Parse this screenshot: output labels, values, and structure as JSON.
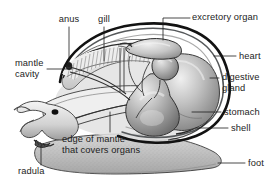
{
  "figure": {
    "organism": "snail",
    "style": "grayscale airbrushed scientific illustration",
    "background_color": "#ffffff",
    "line_color": "#1d1d1d",
    "label_text_color": "#1d1d1d",
    "palette": {
      "outline": "#151515",
      "shell_light": "#e8e8e8",
      "shell_mid": "#b9b9b9",
      "shell_dark": "#6e6e6e",
      "organ_light": "#dcdcdc",
      "organ_mid": "#a8a8a8",
      "organ_dark": "#6a6a6a",
      "foot_light": "#cfcfcf",
      "foot_mid": "#b0b0b0",
      "mantle_light": "#f2f2f2",
      "gill_line": "#7c7c7c",
      "eye_dark": "#101010"
    }
  },
  "labels": [
    {
      "id": "anus",
      "text": "anus",
      "x": 69,
      "y": 22,
      "align": "center",
      "lines": [
        "anus"
      ]
    },
    {
      "id": "gill",
      "text": "gill",
      "x": 104,
      "y": 22,
      "align": "center",
      "lines": [
        "gill"
      ]
    },
    {
      "id": "excretory-organ",
      "text": "excretory organ",
      "x": 194,
      "y": 13,
      "align": "left",
      "lines": [
        "excretory organ"
      ]
    },
    {
      "id": "mantle-cavity",
      "text": "mantle cavity",
      "x": 17,
      "y": 58,
      "align": "left",
      "lines": [
        "mantle",
        "cavity"
      ]
    },
    {
      "id": "heart",
      "text": "heart",
      "x": 240,
      "y": 53,
      "align": "left",
      "lines": [
        "heart"
      ]
    },
    {
      "id": "digestive-gland",
      "text": "digestive gland",
      "x": 222,
      "y": 74,
      "align": "left",
      "lines": [
        "digestive",
        "gland"
      ]
    },
    {
      "id": "stomach",
      "text": "stomach",
      "x": 224,
      "y": 108,
      "align": "left",
      "lines": [
        "stomach"
      ]
    },
    {
      "id": "shell",
      "text": "shell",
      "x": 231,
      "y": 124,
      "align": "left",
      "lines": [
        "shell"
      ]
    },
    {
      "id": "foot",
      "text": "foot",
      "x": 248,
      "y": 159,
      "align": "left",
      "lines": [
        "foot"
      ]
    },
    {
      "id": "radula",
      "text": "radula",
      "x": 20,
      "y": 167,
      "align": "left",
      "lines": [
        "radula"
      ]
    },
    {
      "id": "edge-of-mantle",
      "text": "edge of mantle that covers organs",
      "x": 62,
      "y": 135,
      "align": "left",
      "lines": [
        "edge of mantle",
        "that covers organs"
      ]
    }
  ],
  "label_text": {
    "anus": "anus",
    "gill": "gill",
    "excretory_organ": "excretory organ",
    "mantle_line1": "mantle",
    "mantle_line2": "cavity",
    "heart": "heart",
    "digestive_line1": "digestive",
    "digestive_line2": "gland",
    "stomach": "stomach",
    "shell": "shell",
    "foot": "foot",
    "radula": "radula",
    "mantle_edge_line1": "edge of mantle",
    "mantle_edge_line2": "that covers organs"
  },
  "leader_lines": [
    {
      "for": "anus",
      "path": "M69,27 L69,64",
      "endpoint_dot": true,
      "dot": {
        "x": 69,
        "y": 65,
        "r": 2.1
      }
    },
    {
      "for": "gill",
      "path": "M104,27 L104,61",
      "endpoint_dot": false
    },
    {
      "for": "excretory-organ",
      "path": "M163,40 L163,18 L190,18",
      "endpoint_dot": false
    },
    {
      "for": "mantle-cavity",
      "path": "M47,69 L72,69",
      "endpoint_dot": false
    },
    {
      "for": "heart",
      "path": "M214,56 L236,56",
      "endpoint_dot": false
    },
    {
      "for": "digestive-gland",
      "path": "M210,78 L219,78",
      "endpoint_dot": false
    },
    {
      "for": "stomach",
      "path": "M192,112 L221,112",
      "endpoint_dot": false
    },
    {
      "for": "shell",
      "path": "M196,128 L228,128",
      "endpoint_dot": false
    },
    {
      "for": "foot",
      "path": "M218,163 L245,163",
      "endpoint_dot": false
    },
    {
      "for": "radula",
      "path": "M41,165 L41,146",
      "endpoint_dot": false
    },
    {
      "for": "edge-of-mantle",
      "path": "M110,132 L110,112",
      "endpoint_dot": false
    }
  ],
  "anatomy_parts": [
    {
      "id": "shell",
      "name": "shell",
      "description": "thick dark coiled outer shell enclosing the visceral mass"
    },
    {
      "id": "mantle-cavity",
      "name": "mantle cavity",
      "description": "open space beneath the shell containing the gill"
    },
    {
      "id": "gill",
      "name": "gill",
      "description": "comb-like ctenidium with fine radiating filaments"
    },
    {
      "id": "anus",
      "name": "anus",
      "description": "opening at the anterior edge of the mantle cavity"
    },
    {
      "id": "excretory-organ",
      "name": "excretory organ",
      "description": "kidney lying above the heart"
    },
    {
      "id": "heart",
      "name": "heart",
      "description": "small chambered organ in the pericardial region"
    },
    {
      "id": "digestive-gland",
      "name": "digestive gland",
      "description": "large lobed mass filling the shell whorl"
    },
    {
      "id": "stomach",
      "name": "stomach",
      "description": "rounded sac connected to the digestive gland"
    },
    {
      "id": "foot",
      "name": "foot",
      "description": "large speckled muscular creeping sole"
    },
    {
      "id": "radula",
      "name": "radula",
      "description": "rasping toothed ribbon in the mouth"
    },
    {
      "id": "edge-of-mantle",
      "name": "edge of mantle that covers organs",
      "description": "mantle margin draping over the visceral organs"
    }
  ]
}
